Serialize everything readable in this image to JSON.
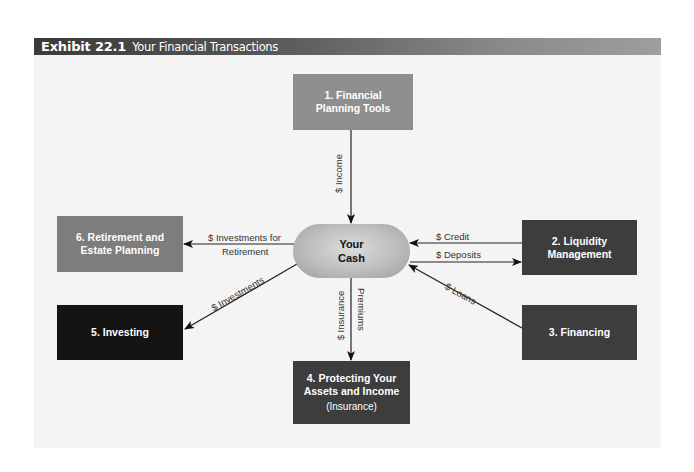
{
  "header": {
    "exhibit_number": "Exhibit 22.1",
    "title": "Your Financial Transactions"
  },
  "center": {
    "line1": "Your",
    "line2": "Cash"
  },
  "boxes": [
    {
      "id": 1,
      "line1": "1. Financial",
      "line2": "Planning Tools",
      "color": "#8f8f8f"
    },
    {
      "id": 2,
      "line1": "2. Liquidity",
      "line2": "Management",
      "color": "#3d3d3d"
    },
    {
      "id": 3,
      "line1": "3. Financing",
      "color": "#3d3d3d"
    },
    {
      "id": 4,
      "line1": "4. Protecting Your",
      "line2": "Assets and Income",
      "sub": "(Insurance)",
      "color": "#3d3d3d"
    },
    {
      "id": 5,
      "line1": "5. Investing",
      "color": "#141414"
    },
    {
      "id": 6,
      "line1": "6. Retirement and",
      "line2": "Estate Planning",
      "color": "#7d7d7d"
    }
  ],
  "flows": {
    "income": "$ Income",
    "retirement_line1": "$ Investments for",
    "retirement_line2": "Retirement",
    "credit": "$ Credit",
    "deposits": "$ Deposits",
    "loans": "$ Loans",
    "investments": "$ Investments",
    "insurance_line1": "$ Insurance",
    "insurance_line2": "Premiums"
  }
}
